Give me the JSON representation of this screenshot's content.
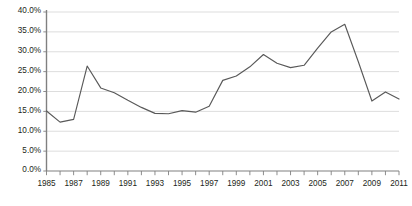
{
  "chart_data": {
    "type": "line",
    "title": "",
    "subtitle": "",
    "xlabel": "",
    "ylabel": "",
    "legend": [],
    "legend_position": "none",
    "grid": "horizontal",
    "xlim": [
      1985,
      2011
    ],
    "ylim": [
      0,
      40
    ],
    "y_tick_labels": [
      "40.0%",
      "35.0%",
      "30.0%",
      "25.0%",
      "20.0%",
      "15.0%",
      "10.0%",
      "5.0%",
      "0.0%"
    ],
    "y_tick_values": [
      40,
      35,
      30,
      25,
      20,
      15,
      10,
      5,
      0
    ],
    "x_tick_labels": [
      "1985",
      "",
      "1987",
      "",
      "1989",
      "",
      "1991",
      "",
      "1993",
      "",
      "1995",
      "",
      "1997",
      "",
      "1999",
      "",
      "2001",
      "",
      "2003",
      "",
      "2005",
      "",
      "2007",
      "",
      "2009",
      "",
      "2011"
    ],
    "x_tick_values": [
      1985,
      1986,
      1987,
      1988,
      1989,
      1990,
      1991,
      1992,
      1993,
      1994,
      1995,
      1996,
      1997,
      1998,
      1999,
      2000,
      2001,
      2002,
      2003,
      2004,
      2005,
      2006,
      2007,
      2008,
      2009,
      2010,
      2011
    ],
    "series": [
      {
        "name": "series-1",
        "color": "#595959",
        "x": [
          1985,
          1986,
          1987,
          1988,
          1989,
          1990,
          1991,
          1992,
          1993,
          1994,
          1995,
          1996,
          1997,
          1998,
          1999,
          2000,
          2001,
          2002,
          2003,
          2004,
          2005,
          2006,
          2007,
          2008,
          2009,
          2010,
          2011
        ],
        "values": [
          15.1,
          12.3,
          13.0,
          26.4,
          20.9,
          19.7,
          17.8,
          16.0,
          14.5,
          14.4,
          15.2,
          14.8,
          16.3,
          22.8,
          23.9,
          26.2,
          29.3,
          27.1,
          26.0,
          26.6,
          30.9,
          35.0,
          36.9,
          27.5,
          17.6,
          19.9,
          18.1
        ]
      }
    ]
  },
  "axis_colors": {
    "grid": "#d9d9d9",
    "axis": "#808080",
    "text": "#231f20",
    "line": "#595959"
  }
}
